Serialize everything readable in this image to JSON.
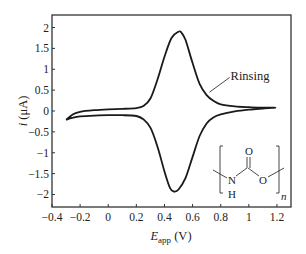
{
  "chart_data": {
    "type": "line",
    "title": "",
    "xlabel": "E_app (V)",
    "xlabel_main": "E",
    "xlabel_sub": "app",
    "xlabel_unit": " (V)",
    "ylabel": "i (μA)",
    "ylabel_main": "i",
    "ylabel_unit": " (μA)",
    "xlim": [
      -0.4,
      1.3
    ],
    "ylim": [
      -2.3,
      2.3
    ],
    "xticks": [
      -0.4,
      -0.2,
      0,
      0.2,
      0.4,
      0.6,
      0.8,
      1,
      1.2
    ],
    "xtick_labels": [
      "−0.4",
      "−0.2",
      "0",
      "0.2",
      "0.4",
      "0.6",
      "0.8",
      "1",
      "1.2"
    ],
    "yticks": [
      2,
      1.5,
      1,
      0.5,
      0,
      -0.5,
      -1,
      -1.5,
      -2
    ],
    "ytick_labels": [
      "2",
      "1.5",
      "1",
      "0.5",
      "0",
      "−0.5",
      "−1",
      "−1.5",
      "−2"
    ],
    "grid": false,
    "legend": null,
    "series": [
      {
        "name": "Rinsing",
        "color": "#1a1a1a",
        "forward_scan": {
          "x": [
            -0.3,
            -0.25,
            -0.2,
            -0.1,
            0.0,
            0.1,
            0.2,
            0.25,
            0.3,
            0.35,
            0.4,
            0.45,
            0.5,
            0.52,
            0.55,
            0.6,
            0.65,
            0.7,
            0.75,
            0.8,
            0.9,
            1.0,
            1.1,
            1.19
          ],
          "y": [
            -0.21,
            -0.08,
            -0.02,
            0.02,
            0.04,
            0.05,
            0.07,
            0.12,
            0.3,
            0.75,
            1.3,
            1.75,
            1.9,
            1.88,
            1.7,
            1.15,
            0.65,
            0.38,
            0.24,
            0.16,
            0.11,
            0.09,
            0.08,
            0.08
          ]
        },
        "reverse_scan": {
          "x": [
            1.19,
            1.1,
            1.0,
            0.9,
            0.8,
            0.75,
            0.7,
            0.65,
            0.6,
            0.55,
            0.5,
            0.47,
            0.44,
            0.4,
            0.35,
            0.3,
            0.25,
            0.2,
            0.1,
            0.0,
            -0.1,
            -0.2,
            -0.25,
            -0.3
          ],
          "y": [
            0.08,
            0.06,
            0.03,
            -0.01,
            -0.08,
            -0.15,
            -0.3,
            -0.6,
            -1.1,
            -1.6,
            -1.88,
            -1.93,
            -1.85,
            -1.45,
            -0.85,
            -0.4,
            -0.2,
            -0.12,
            -0.1,
            -0.1,
            -0.11,
            -0.13,
            -0.16,
            -0.21
          ]
        }
      }
    ],
    "annotations": [
      {
        "text": "Rinsing",
        "x": 0.87,
        "y": 0.85,
        "arrow_to": [
          0.72,
          0.45
        ]
      }
    ],
    "inset": {
      "type": "chemical-structure",
      "description": "carbamate repeat unit [–NH–C(=O)–O–]n",
      "atoms": {
        "N": "N",
        "H": "H",
        "C": "",
        "O_carbonyl": "O",
        "O_ester": "O"
      },
      "subscript": "n"
    }
  }
}
